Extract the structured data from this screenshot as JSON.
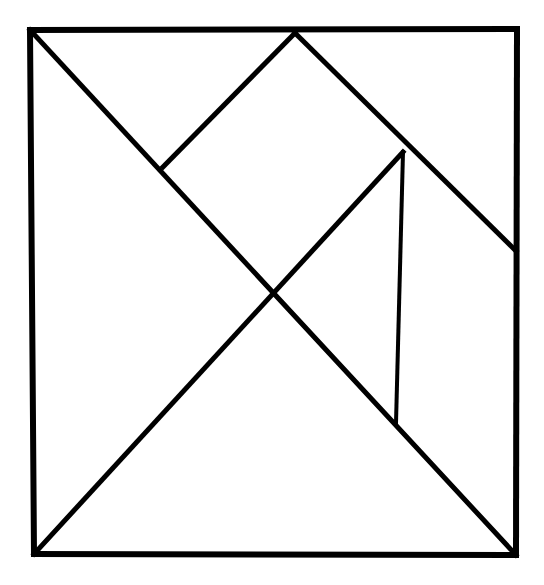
{
  "figure": {
    "kind": "tangram-dissection-diagram",
    "title": "Tangram square dissection",
    "background_color": "#ffffff",
    "ink_color": "#000000",
    "canvas": {
      "width": 544,
      "height": 585
    },
    "stroke": {
      "outer_width": 6,
      "inner_width": 5,
      "thin_width": 4
    }
  },
  "geometry": {
    "points": {
      "top_left": {
        "label": "A",
        "x": 30,
        "y": 30
      },
      "top_apex": {
        "label": "B",
        "x": 295,
        "y": 33
      },
      "top_right": {
        "label": "C",
        "x": 517,
        "y": 29
      },
      "right_mid": {
        "label": "D",
        "x": 516,
        "y": 251
      },
      "bottom_right": {
        "label": "E",
        "x": 516,
        "y": 555
      },
      "bottom_left": {
        "label": "F",
        "x": 34,
        "y": 554
      },
      "left_mid": {
        "label": "G",
        "x": 163,
        "y": 167
      },
      "right_knot": {
        "label": "H",
        "x": 403,
        "y": 152
      },
      "center_cross": {
        "label": "I",
        "x": 273,
        "y": 292
      },
      "notch_foot": {
        "label": "J",
        "x": 396,
        "y": 423
      }
    },
    "segments": [
      {
        "name": "outer-border-top",
        "from": "top_left",
        "to": "top_right",
        "weight": "outer"
      },
      {
        "name": "outer-border-right",
        "from": "top_right",
        "to": "bottom_right",
        "weight": "outer"
      },
      {
        "name": "outer-border-bottom",
        "from": "bottom_right",
        "to": "bottom_left",
        "weight": "outer"
      },
      {
        "name": "outer-border-left",
        "from": "bottom_left",
        "to": "top_left",
        "weight": "outer"
      },
      {
        "name": "main-diagonal-tl-br",
        "from": "top_left",
        "to": "bottom_right",
        "weight": "inner"
      },
      {
        "name": "apex-to-left-mid",
        "from": "top_apex",
        "to": "left_mid",
        "weight": "inner"
      },
      {
        "name": "apex-to-right-edge",
        "from": "top_apex",
        "to": "right_mid",
        "weight": "inner"
      },
      {
        "name": "right-knot-to-bottom-left",
        "from": "right_knot",
        "to": "bottom_left",
        "weight": "inner"
      },
      {
        "name": "notch-vertical",
        "from": "right_knot",
        "to": "notch_foot",
        "weight": "thin"
      }
    ]
  },
  "chart_data": {
    "type": "diagram",
    "title": "Tangram square dissection",
    "shapes": [
      {
        "name": "large-triangle-left",
        "vertices": [
          [
            30,
            30
          ],
          [
            273,
            292
          ],
          [
            34,
            554
          ]
        ]
      },
      {
        "name": "large-triangle-bottom",
        "vertices": [
          [
            34,
            554
          ],
          [
            273,
            292
          ],
          [
            516,
            555
          ]
        ]
      },
      {
        "name": "medium-triangle-right",
        "vertices": [
          [
            403,
            152
          ],
          [
            516,
            251
          ],
          [
            516,
            555
          ]
        ]
      },
      {
        "name": "small-triangle-top",
        "vertices": [
          [
            163,
            167
          ],
          [
            295,
            33
          ],
          [
            30,
            30
          ]
        ]
      },
      {
        "name": "small-triangle-notch",
        "vertices": [
          [
            403,
            152
          ],
          [
            396,
            423
          ],
          [
            516,
            555
          ]
        ]
      },
      {
        "name": "square-piece",
        "vertices": [
          [
            163,
            167
          ],
          [
            295,
            33
          ],
          [
            403,
            152
          ],
          [
            273,
            292
          ]
        ]
      },
      {
        "name": "rhomboid-piece",
        "vertices": [
          [
            295,
            33
          ],
          [
            517,
            29
          ],
          [
            516,
            251
          ],
          [
            403,
            152
          ]
        ]
      }
    ]
  }
}
